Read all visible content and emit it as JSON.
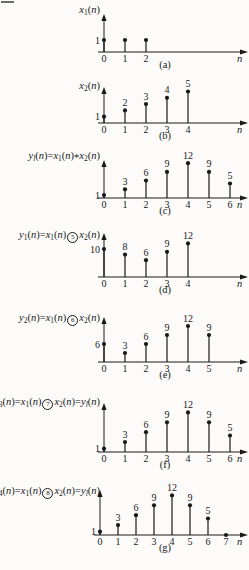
{
  "figure": {
    "background": "#fcfbf9",
    "ink_color": "#1a1a1a"
  },
  "chart_data": [
    {
      "type": "stem",
      "id": "a",
      "caption": "(a)",
      "title": "x₁(n)",
      "title_parts": [
        {
          "t": "x",
          "st": "i"
        },
        {
          "t": "1",
          "st": "s"
        },
        {
          "t": "(",
          "st": "p"
        },
        {
          "t": "n",
          "st": "i"
        },
        {
          "t": ")",
          "st": "p"
        }
      ],
      "xlabel": "n",
      "x": [
        0,
        1,
        2
      ],
      "values": [
        1,
        1,
        1
      ],
      "xticks": [
        "0",
        "1",
        "2"
      ],
      "axis_value_label": "1",
      "point_labels": [
        "",
        "",
        ""
      ]
    },
    {
      "type": "stem",
      "id": "b",
      "caption": "(b)",
      "title": "x₂(n)",
      "title_parts": [
        {
          "t": "x",
          "st": "i"
        },
        {
          "t": "2",
          "st": "s"
        },
        {
          "t": "(",
          "st": "p"
        },
        {
          "t": "n",
          "st": "i"
        },
        {
          "t": ")",
          "st": "p"
        }
      ],
      "xlabel": "n",
      "x": [
        0,
        1,
        2,
        3,
        4
      ],
      "values": [
        1,
        2,
        3,
        4,
        5
      ],
      "xticks": [
        "0",
        "1",
        "2",
        "3",
        "4"
      ],
      "axis_value_label": "1",
      "point_labels": [
        "",
        "2",
        "3",
        "4",
        "5"
      ]
    },
    {
      "type": "stem",
      "id": "c",
      "caption": "(c)",
      "title": "yₗ(n)=x₁(n)*x₂(n)",
      "title_parts": [
        {
          "t": "y",
          "st": "i"
        },
        {
          "t": "l",
          "st": "si"
        },
        {
          "t": "(",
          "st": "p"
        },
        {
          "t": "n",
          "st": "i"
        },
        {
          "t": ")=",
          "st": "p"
        },
        {
          "t": "x",
          "st": "i"
        },
        {
          "t": "1",
          "st": "s"
        },
        {
          "t": "(",
          "st": "p"
        },
        {
          "t": "n",
          "st": "i"
        },
        {
          "t": ")",
          "st": "p"
        },
        {
          "t": "*",
          "st": "a"
        },
        {
          "t": "x",
          "st": "i"
        },
        {
          "t": "2",
          "st": "s"
        },
        {
          "t": "(",
          "st": "p"
        },
        {
          "t": "n",
          "st": "i"
        },
        {
          "t": ")",
          "st": "p"
        }
      ],
      "xlabel": "n",
      "x": [
        0,
        1,
        2,
        3,
        4,
        5,
        6
      ],
      "values": [
        1,
        3,
        6,
        9,
        12,
        9,
        5
      ],
      "xticks": [
        "0",
        "1",
        "2",
        "3",
        "4",
        "5",
        "6"
      ],
      "axis_value_label": "1",
      "point_labels": [
        "",
        "3",
        "6",
        "9",
        "12",
        "9",
        "5"
      ]
    },
    {
      "type": "stem",
      "id": "d",
      "caption": "(d)",
      "title": "y₁(n)=x₁(n)⑤x₂(n)",
      "title_parts": [
        {
          "t": "y",
          "st": "i"
        },
        {
          "t": "1",
          "st": "s"
        },
        {
          "t": "(",
          "st": "p"
        },
        {
          "t": "n",
          "st": "i"
        },
        {
          "t": ")=",
          "st": "p"
        },
        {
          "t": "x",
          "st": "i"
        },
        {
          "t": "1",
          "st": "s"
        },
        {
          "t": "(",
          "st": "p"
        },
        {
          "t": "n",
          "st": "i"
        },
        {
          "t": ")",
          "st": "p"
        },
        {
          "t": "5",
          "st": "c"
        },
        {
          "t": "x",
          "st": "i"
        },
        {
          "t": "2",
          "st": "s"
        },
        {
          "t": "(",
          "st": "p"
        },
        {
          "t": "n",
          "st": "i"
        },
        {
          "t": ")",
          "st": "p"
        }
      ],
      "xlabel": "n",
      "x": [
        0,
        1,
        2,
        3,
        4
      ],
      "values": [
        10,
        8,
        6,
        9,
        12
      ],
      "xticks": [
        "0",
        "1",
        "2",
        "3",
        "4"
      ],
      "axis_value_label": "10",
      "point_labels": [
        "",
        "8",
        "6",
        "9",
        "12"
      ]
    },
    {
      "type": "stem",
      "id": "e",
      "caption": "(e)",
      "title": "y₂(n)=x₁(n)⑥x₂(n)",
      "title_parts": [
        {
          "t": "y",
          "st": "i"
        },
        {
          "t": "2",
          "st": "s"
        },
        {
          "t": "(",
          "st": "p"
        },
        {
          "t": "n",
          "st": "i"
        },
        {
          "t": ")=",
          "st": "p"
        },
        {
          "t": "x",
          "st": "i"
        },
        {
          "t": "1",
          "st": "s"
        },
        {
          "t": "(",
          "st": "p"
        },
        {
          "t": "n",
          "st": "i"
        },
        {
          "t": ")",
          "st": "p"
        },
        {
          "t": "6",
          "st": "c"
        },
        {
          "t": "x",
          "st": "i"
        },
        {
          "t": "2",
          "st": "s"
        },
        {
          "t": "(",
          "st": "p"
        },
        {
          "t": "n",
          "st": "i"
        },
        {
          "t": ")",
          "st": "p"
        }
      ],
      "xlabel": "n",
      "x": [
        0,
        1,
        2,
        3,
        4,
        5
      ],
      "values": [
        6,
        3,
        6,
        9,
        12,
        9
      ],
      "xticks": [
        "0",
        "1",
        "2",
        "3",
        "4",
        "5"
      ],
      "axis_value_label": "6",
      "point_labels": [
        "",
        "3",
        "6",
        "9",
        "12",
        "9"
      ]
    },
    {
      "type": "stem",
      "id": "f",
      "caption": "(f)",
      "title": "y₃(n)=x₁(n)⑦x₂(n)=yₗ(n)",
      "title_parts": [
        {
          "t": "y",
          "st": "i"
        },
        {
          "t": "3",
          "st": "s"
        },
        {
          "t": "(",
          "st": "p"
        },
        {
          "t": "n",
          "st": "i"
        },
        {
          "t": ")=",
          "st": "p"
        },
        {
          "t": "x",
          "st": "i"
        },
        {
          "t": "1",
          "st": "s"
        },
        {
          "t": "(",
          "st": "p"
        },
        {
          "t": "n",
          "st": "i"
        },
        {
          "t": ")",
          "st": "p"
        },
        {
          "t": "7",
          "st": "c"
        },
        {
          "t": "x",
          "st": "i"
        },
        {
          "t": "2",
          "st": "s"
        },
        {
          "t": "(",
          "st": "p"
        },
        {
          "t": "n",
          "st": "i"
        },
        {
          "t": ")",
          "st": "p"
        },
        {
          "t": "=",
          "st": "p"
        },
        {
          "t": "y",
          "st": "i"
        },
        {
          "t": "l",
          "st": "si"
        },
        {
          "t": "(",
          "st": "p"
        },
        {
          "t": "n",
          "st": "i"
        },
        {
          "t": ")",
          "st": "p"
        }
      ],
      "xlabel": "n",
      "x": [
        0,
        1,
        2,
        3,
        4,
        5,
        6
      ],
      "values": [
        1,
        3,
        6,
        9,
        12,
        9,
        5
      ],
      "xticks": [
        "0",
        "1",
        "2",
        "3",
        "4",
        "5",
        "6"
      ],
      "axis_value_label": "1",
      "point_labels": [
        "",
        "3",
        "6",
        "9",
        "12",
        "9",
        "5"
      ]
    },
    {
      "type": "stem",
      "id": "g",
      "caption": "(g)",
      "title": "y₄(n)=x₁(n)⑧x₂(n)=yₗ(n)",
      "title_parts": [
        {
          "t": "y",
          "st": "i"
        },
        {
          "t": "4",
          "st": "s"
        },
        {
          "t": "(",
          "st": "p"
        },
        {
          "t": "n",
          "st": "i"
        },
        {
          "t": ")=",
          "st": "p"
        },
        {
          "t": "x",
          "st": "i"
        },
        {
          "t": "1",
          "st": "s"
        },
        {
          "t": "(",
          "st": "p"
        },
        {
          "t": "n",
          "st": "i"
        },
        {
          "t": ")",
          "st": "p"
        },
        {
          "t": "8",
          "st": "c"
        },
        {
          "t": "x",
          "st": "i"
        },
        {
          "t": "2",
          "st": "s"
        },
        {
          "t": "(",
          "st": "p"
        },
        {
          "t": "n",
          "st": "i"
        },
        {
          "t": ")",
          "st": "p"
        },
        {
          "t": "=",
          "st": "p"
        },
        {
          "t": "y",
          "st": "i"
        },
        {
          "t": "l",
          "st": "si"
        },
        {
          "t": "(",
          "st": "p"
        },
        {
          "t": "n",
          "st": "i"
        },
        {
          "t": ")",
          "st": "p"
        }
      ],
      "xlabel": "n",
      "x": [
        0,
        1,
        2,
        3,
        4,
        5,
        6,
        7
      ],
      "values": [
        1,
        3,
        6,
        9,
        12,
        9,
        5,
        0
      ],
      "xticks": [
        "0",
        "1",
        "2",
        "3",
        "4",
        "5",
        "6",
        "7"
      ],
      "axis_value_label": "1",
      "point_labels": [
        "",
        "3",
        "6",
        "9",
        "12",
        "9",
        "5",
        ""
      ]
    }
  ]
}
